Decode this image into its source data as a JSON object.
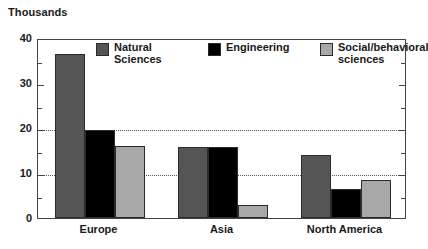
{
  "unit_label": "Thousands",
  "legend": {
    "items": [
      {
        "label": "Natural\nSciences",
        "color": "#555555",
        "name": "natural-sciences"
      },
      {
        "label": "Engineering",
        "color": "#000000",
        "name": "engineering"
      },
      {
        "label": "Social/behavioral\nsciences",
        "color": "#a8a8a8",
        "name": "social-behavioral-sciences"
      }
    ]
  },
  "axis": {
    "y_ticks": [
      "0",
      "10",
      "20",
      "30",
      "40"
    ],
    "y_minor_ticks": [
      5,
      15,
      25,
      35
    ],
    "gridline_values": [
      10,
      20
    ],
    "x_labels": [
      "Europe",
      "Asia",
      "North America"
    ]
  },
  "chart_data": {
    "type": "bar",
    "title": "",
    "subtitle": "",
    "xlabel": "",
    "ylabel": "Thousands",
    "ylim": [
      0,
      40
    ],
    "ytick_values": [
      0,
      10,
      20,
      30,
      40
    ],
    "grid": "horizontal dotted gridlines at 10 and 20",
    "legend_position": "inside top",
    "categories": [
      "Europe",
      "Asia",
      "North America"
    ],
    "series": [
      {
        "name": "Natural Sciences",
        "color": "#555555",
        "values": [
          36.5,
          15.8,
          14.0
        ]
      },
      {
        "name": "Engineering",
        "color": "#000000",
        "values": [
          19.5,
          15.7,
          6.5
        ]
      },
      {
        "name": "Social/behavioral sciences",
        "color": "#a8a8a8",
        "values": [
          16.0,
          3.0,
          8.5
        ]
      }
    ]
  }
}
